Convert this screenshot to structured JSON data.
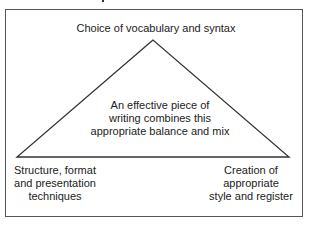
{
  "diagram": {
    "type": "triangle",
    "top_vertex_label": "Choice of vocabulary and syntax",
    "center_label": [
      "An effective piece of",
      "writing combines this",
      "appropriate balance and mix"
    ],
    "bottom_left_label": [
      "Structure, format",
      "and presentation",
      "techniques"
    ],
    "bottom_right_label": [
      "Creation of",
      "appropriate",
      "style and register"
    ],
    "colors": {
      "stroke": "#333333",
      "text": "#222222",
      "background": "#ffffff"
    }
  }
}
